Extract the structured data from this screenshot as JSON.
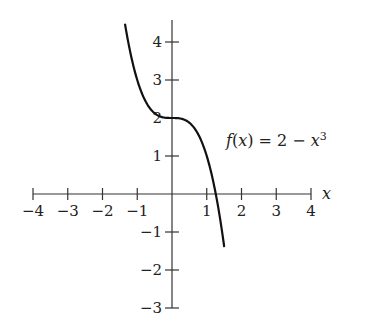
{
  "chart_data": {
    "type": "line",
    "title": "",
    "xlabel": "x",
    "ylabel": "",
    "xlim": [
      -4,
      4
    ],
    "ylim": [
      -3,
      4.6
    ],
    "x_ticks": [
      -4,
      -3,
      -2,
      -1,
      1,
      2,
      3,
      4
    ],
    "x_tick_labels": [
      "−4",
      "−3",
      "−2",
      "−1",
      "1",
      "2",
      "3",
      "4"
    ],
    "y_ticks": [
      -3,
      -2,
      -1,
      1,
      2,
      3,
      4
    ],
    "y_tick_labels": [
      "−3",
      "−2",
      "−1",
      "1",
      "2",
      "3",
      "4"
    ],
    "grid": false,
    "legend": null,
    "series": [
      {
        "name": "f(x) = 2 - x^3",
        "expression": "2 - x^3",
        "x_range": [
          -1.35,
          1.5
        ],
        "x": [
          -1.35,
          -1.0,
          -0.5,
          0,
          0.5,
          1.0,
          1.26,
          1.5
        ],
        "y": [
          4.46,
          3.0,
          2.125,
          2.0,
          1.875,
          1.0,
          0.0,
          -1.375
        ]
      }
    ],
    "annotations": [
      {
        "text": "f(x) = 2 − x³",
        "x": 1.6,
        "y": 1.2
      }
    ]
  },
  "labels": {
    "x_axis": "x",
    "func_f": "f",
    "func_open": "(",
    "func_x": "x",
    "func_close": ")",
    "func_eq": " = 2 − ",
    "func_var": "x",
    "func_exp": "3"
  }
}
